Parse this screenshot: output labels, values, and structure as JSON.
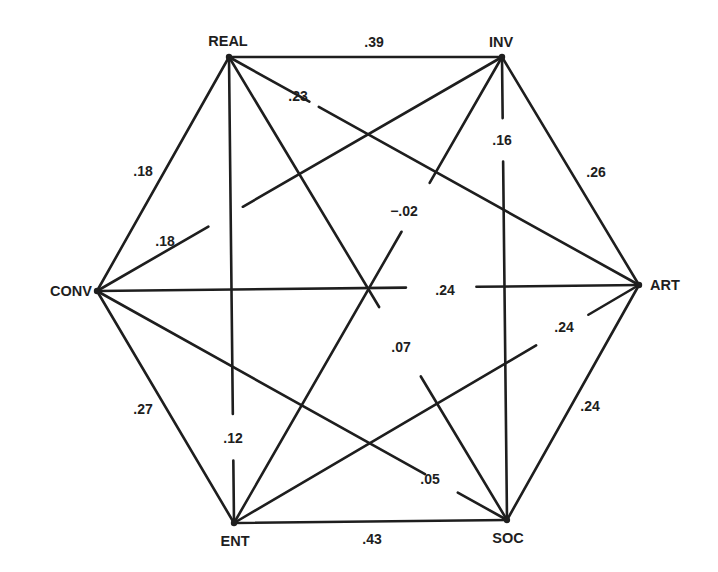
{
  "diagram": {
    "type": "network",
    "shape": "hexagon",
    "colors": {
      "ink": "#1e1e1e",
      "background": "#ffffff"
    },
    "nodes": [
      {
        "id": "REAL",
        "label": "REAL",
        "x": 229,
        "y": 57,
        "lx": 228,
        "ly": 46,
        "anchor": "middle"
      },
      {
        "id": "INV",
        "label": "INV",
        "x": 502,
        "y": 57,
        "lx": 501,
        "ly": 47,
        "anchor": "middle"
      },
      {
        "id": "ART",
        "label": "ART",
        "x": 639,
        "y": 285,
        "lx": 650,
        "ly": 290,
        "anchor": "start"
      },
      {
        "id": "SOC",
        "label": "SOC",
        "x": 507,
        "y": 520,
        "lx": 508,
        "ly": 543,
        "anchor": "middle"
      },
      {
        "id": "ENT",
        "label": "ENT",
        "x": 234,
        "y": 523,
        "lx": 235,
        "ly": 546,
        "anchor": "middle"
      },
      {
        "id": "CONV",
        "label": "CONV",
        "x": 97,
        "y": 291,
        "lx": 92,
        "ly": 296,
        "anchor": "end"
      }
    ],
    "edges": [
      {
        "from": "REAL",
        "to": "INV",
        "value": ".39",
        "lx": 374,
        "ly": 47,
        "gap": null
      },
      {
        "from": "INV",
        "to": "ART",
        "value": ".26",
        "lx": 596,
        "ly": 177,
        "gap": null
      },
      {
        "from": "ART",
        "to": "SOC",
        "value": ".24",
        "lx": 590,
        "ly": 411,
        "gap": null
      },
      {
        "from": "SOC",
        "to": "ENT",
        "value": ".43",
        "lx": 372,
        "ly": 544,
        "gap": null
      },
      {
        "from": "ENT",
        "to": "CONV",
        "value": ".27",
        "lx": 143,
        "ly": 414,
        "gap": null
      },
      {
        "from": "CONV",
        "to": "REAL",
        "value": ".18",
        "lx": 143,
        "ly": 176,
        "gap": null
      },
      {
        "from": "REAL",
        "to": "ART",
        "value": ".23",
        "lx": 298,
        "ly": 101,
        "gap": [
          0.196,
          0.219
        ]
      },
      {
        "from": "REAL",
        "to": "SOC",
        "value": ".07",
        "lx": 401,
        "ly": 352,
        "gap": [
          0.54,
          0.69
        ]
      },
      {
        "from": "REAL",
        "to": "ENT",
        "value": ".12",
        "lx": 233,
        "ly": 443,
        "gap": [
          0.766,
          0.866
        ]
      },
      {
        "from": "INV",
        "to": "CONV",
        "value": ".18",
        "lx": 165,
        "ly": 246,
        "gap": [
          0.64,
          0.725
        ]
      },
      {
        "from": "INV",
        "to": "SOC",
        "value": ".16",
        "lx": 502,
        "ly": 145,
        "gap": [
          0.132,
          0.226
        ]
      },
      {
        "from": "INV",
        "to": "ENT",
        "value": "−.02",
        "lx": 404,
        "ly": 216,
        "gap": [
          0.27,
          0.375
        ]
      },
      {
        "from": "ART",
        "to": "CONV",
        "value": ".24",
        "lx": 445,
        "ly": 295,
        "gap": [
          0.3,
          0.43
        ]
      },
      {
        "from": "ART",
        "to": "ENT",
        "value": ".24",
        "lx": 564,
        "ly": 332,
        "gap": [
          0.125,
          0.254
        ]
      },
      {
        "from": "SOC",
        "to": "CONV",
        "value": ".05",
        "lx": 430,
        "ly": 484,
        "gap": [
          0.12,
          0.2
        ]
      }
    ]
  }
}
